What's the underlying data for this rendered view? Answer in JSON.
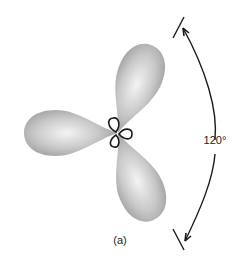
{
  "figure": {
    "panel_label": "(a)",
    "angle_label": "120°",
    "lobe_count": 3,
    "lobe_color": "#a8a8a8",
    "lobe_highlight": "#f2f2f2",
    "line_color": "#1a1a1a"
  }
}
